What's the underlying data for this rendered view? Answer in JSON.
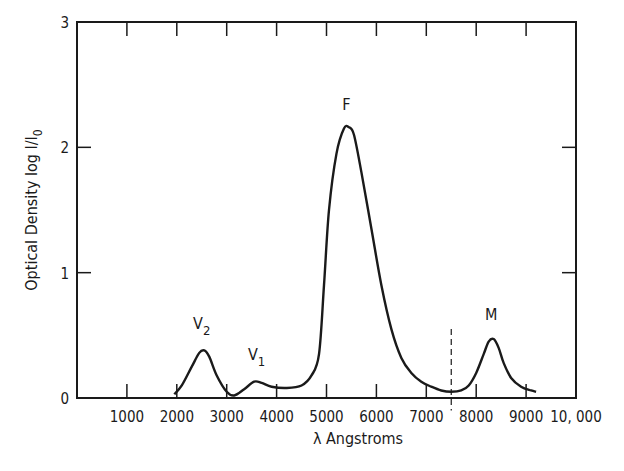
{
  "chart_data": {
    "type": "line",
    "title": "",
    "xlabel": "λ Angstroms",
    "ylabel": "Optical Density  log I/I",
    "ylabel_subscript": "0",
    "xlim": [
      0,
      10000
    ],
    "ylim": [
      0,
      3
    ],
    "grid": false,
    "x_ticks": [
      1000,
      2000,
      3000,
      4000,
      5000,
      6000,
      7000,
      8000,
      9000,
      10000
    ],
    "x_tick_labels": [
      "1000",
      "2000",
      "3000",
      "4000",
      "5000",
      "6000",
      "7000",
      "8000",
      "9000",
      "10, 000"
    ],
    "y_ticks": [
      0,
      1,
      2,
      3
    ],
    "y_tick_labels": [
      "0",
      "1",
      "2",
      "3"
    ],
    "series": [
      {
        "name": "absorption spectrum",
        "x": [
          1950,
          2100,
          2300,
          2450,
          2550,
          2650,
          2800,
          3000,
          3150,
          3350,
          3550,
          3700,
          3900,
          4200,
          4500,
          4700,
          4850,
          4950,
          5050,
          5200,
          5350,
          5450,
          5550,
          5700,
          5900,
          6100,
          6300,
          6500,
          6700,
          6900,
          7100,
          7300,
          7500,
          7700,
          7850,
          8000,
          8150,
          8250,
          8350,
          8450,
          8550,
          8700,
          8900,
          9100,
          9200
        ],
        "y": [
          0.03,
          0.1,
          0.25,
          0.36,
          0.38,
          0.33,
          0.18,
          0.05,
          0.02,
          0.07,
          0.13,
          0.12,
          0.09,
          0.08,
          0.1,
          0.18,
          0.35,
          0.9,
          1.5,
          1.95,
          2.15,
          2.16,
          2.1,
          1.8,
          1.35,
          0.9,
          0.55,
          0.32,
          0.2,
          0.13,
          0.09,
          0.06,
          0.05,
          0.06,
          0.1,
          0.2,
          0.35,
          0.45,
          0.47,
          0.4,
          0.28,
          0.16,
          0.09,
          0.06,
          0.05
        ]
      }
    ],
    "annotations": [
      {
        "text": "V",
        "sub": "2",
        "x": 2500,
        "y": 0.55
      },
      {
        "text": "V",
        "sub": "1",
        "x": 3600,
        "y": 0.3
      },
      {
        "text": "F",
        "x": 5400,
        "y": 2.3
      },
      {
        "text": "M",
        "x": 8300,
        "y": 0.62
      }
    ],
    "reference_lines": [
      {
        "style": "dashed",
        "x": 7500,
        "y_from": -0.1,
        "y_to": 0.55
      }
    ]
  }
}
